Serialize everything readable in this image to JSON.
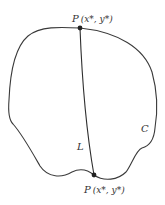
{
  "diagram": {
    "curve_label": "C",
    "chord_label": "L",
    "top_point": {
      "label_prefix": "P",
      "label": "P (x*, y*)",
      "coords": "(x*, y*)"
    },
    "bottom_point": {
      "label_prefix": "P",
      "label": "P (x*, y*)",
      "coords": "(x*, y*)"
    },
    "colors": {
      "stroke": "#3a3a3a",
      "point": "#222222",
      "background": "#ffffff"
    }
  }
}
